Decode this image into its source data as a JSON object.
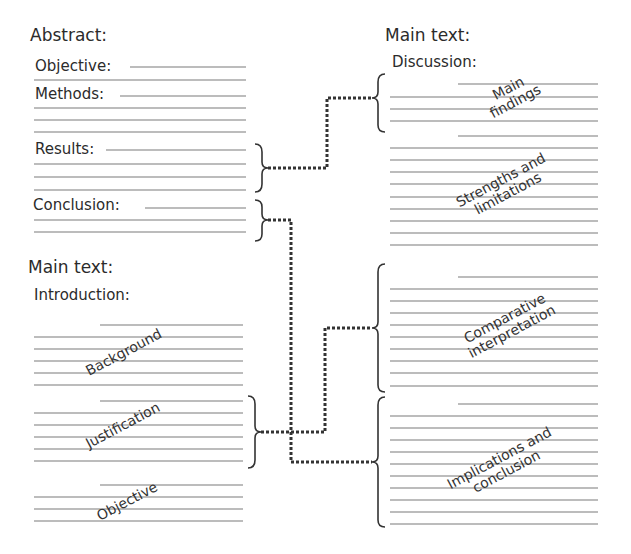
{
  "abstract": {
    "title": "Abstract:",
    "sections": [
      {
        "label": "Objective:"
      },
      {
        "label": "Methods:"
      },
      {
        "label": "Results:"
      },
      {
        "label": "Conclusion:"
      }
    ]
  },
  "main_left": {
    "title": "Main text:",
    "subtitle": "Introduction:",
    "blocks": [
      {
        "label": "Background"
      },
      {
        "label": "Justification"
      },
      {
        "label": "Objective"
      }
    ]
  },
  "main_right": {
    "title": "Main text:",
    "subtitle": "Discussion:",
    "blocks": [
      {
        "label_line1": "Main",
        "label_line2": "findings"
      },
      {
        "label_line1": "Strengths and",
        "label_line2": "limitations"
      },
      {
        "label_line1": "Comparative",
        "label_line2": "interpretation"
      },
      {
        "label_line1": "Implications and",
        "label_line2": "conclusion"
      }
    ]
  },
  "connectors": [
    {
      "from": "Results",
      "to": "Main findings"
    },
    {
      "from": "Conclusion",
      "to": "Implications and conclusion"
    },
    {
      "from": "Justification",
      "to": "Comparative interpretation"
    }
  ],
  "colors": {
    "text": "#2b2b2b",
    "lines": "#9a9a9a",
    "connector": "#333333"
  }
}
